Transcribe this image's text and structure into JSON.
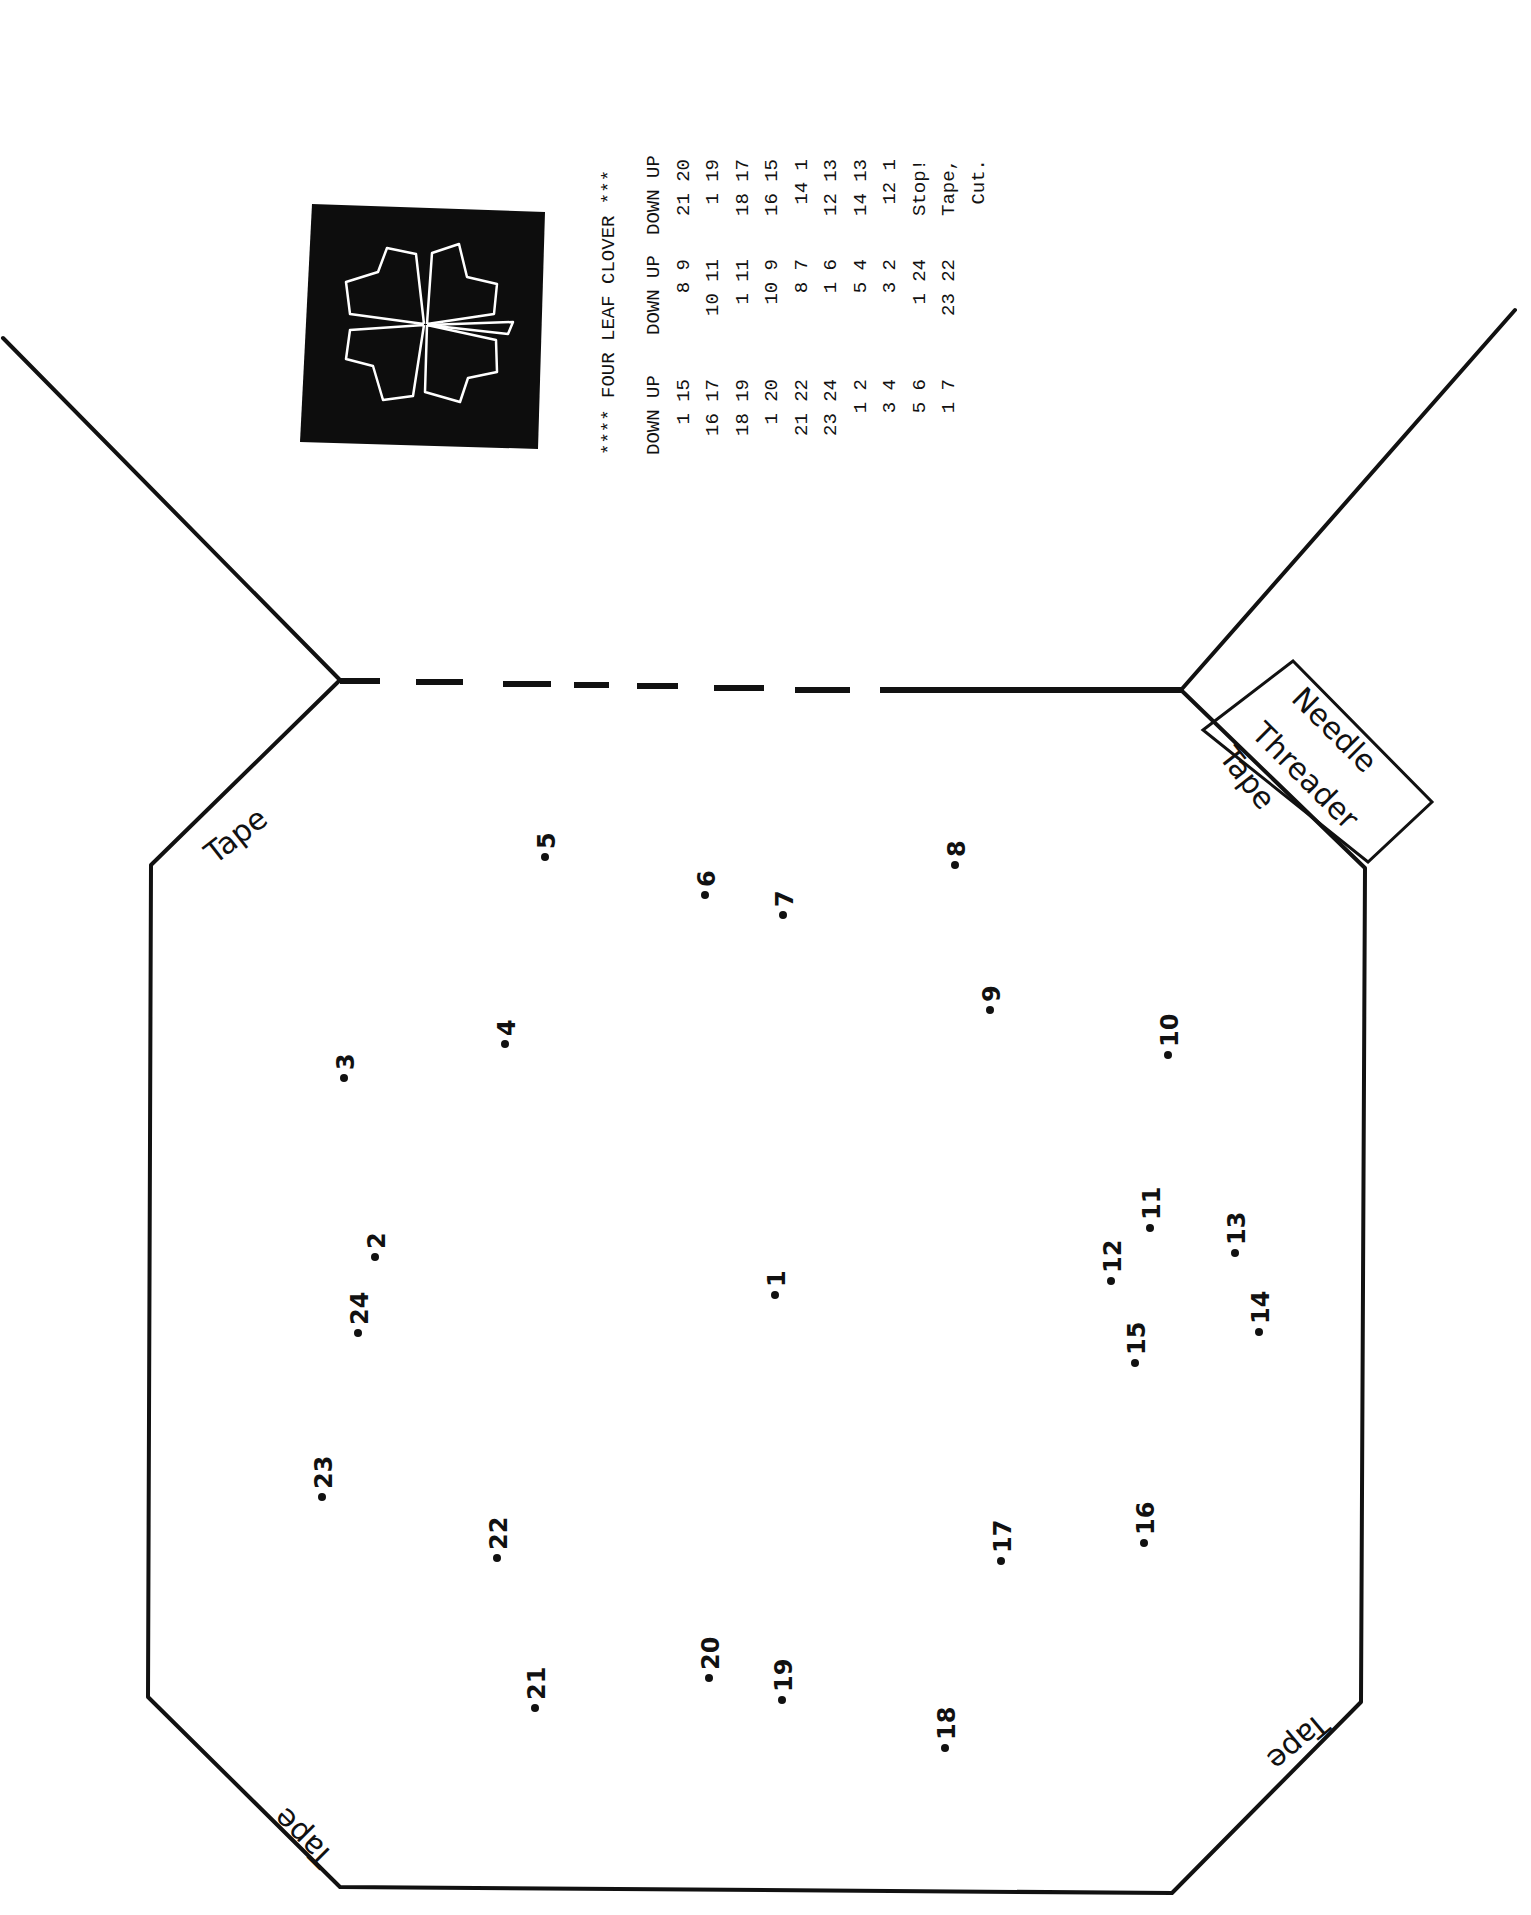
{
  "instructions": {
    "title": "**** FOUR LEAF CLOVER ***",
    "columns": [
      {
        "header": "DOWN UP",
        "rows": [
          "1 15",
          "16 17",
          "18 19",
          "1 20",
          "21 22",
          "23 24",
          "1 2",
          "3 4",
          "5 6",
          "1 7"
        ]
      },
      {
        "header": "DOWN UP",
        "rows": [
          "8 9",
          "10 11",
          "1 11",
          "10 9",
          "8 7",
          "1 6",
          "5 4",
          "3 2",
          "1 24",
          "23 22"
        ]
      },
      {
        "header": "DOWN UP",
        "rows": [
          "21 20",
          "1 19",
          "18 17",
          "16 15",
          "14 1",
          "12 13",
          "14 13",
          "12 1",
          "Stop!",
          "Tape,",
          "Cut."
        ]
      }
    ]
  },
  "preview_image": {
    "label": "four-leaf clover stitched preview",
    "background": "#0d0d0d",
    "stroke": "#ffffff"
  },
  "labels": {
    "tape_top_left": "Tape",
    "tape_top_right": "Tape",
    "tape_bottom_left": "Tape",
    "tape_bottom_right": "Tape",
    "needle_threader_line1": "Needle",
    "needle_threader_line2": "Threader"
  },
  "points": [
    {
      "n": "1",
      "x": 775,
      "y": 1295
    },
    {
      "n": "2",
      "x": 375,
      "y": 1257
    },
    {
      "n": "3",
      "x": 344,
      "y": 1078
    },
    {
      "n": "4",
      "x": 505,
      "y": 1044
    },
    {
      "n": "5",
      "x": 545,
      "y": 857
    },
    {
      "n": "6",
      "x": 705,
      "y": 895
    },
    {
      "n": "7",
      "x": 783,
      "y": 915
    },
    {
      "n": "8",
      "x": 955,
      "y": 865
    },
    {
      "n": "9",
      "x": 990,
      "y": 1010
    },
    {
      "n": "10",
      "x": 1168,
      "y": 1055
    },
    {
      "n": "11",
      "x": 1150,
      "y": 1228
    },
    {
      "n": "12",
      "x": 1111,
      "y": 1281
    },
    {
      "n": "13",
      "x": 1235,
      "y": 1253
    },
    {
      "n": "14",
      "x": 1259,
      "y": 1332
    },
    {
      "n": "15",
      "x": 1135,
      "y": 1363
    },
    {
      "n": "16",
      "x": 1144,
      "y": 1543
    },
    {
      "n": "17",
      "x": 1001,
      "y": 1561
    },
    {
      "n": "18",
      "x": 945,
      "y": 1748
    },
    {
      "n": "19",
      "x": 782,
      "y": 1700
    },
    {
      "n": "20",
      "x": 709,
      "y": 1678
    },
    {
      "n": "21",
      "x": 535,
      "y": 1708
    },
    {
      "n": "22",
      "x": 497,
      "y": 1558
    },
    {
      "n": "23",
      "x": 322,
      "y": 1497
    },
    {
      "n": "24",
      "x": 358,
      "y": 1333
    }
  ]
}
